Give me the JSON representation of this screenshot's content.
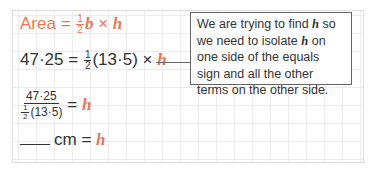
{
  "line1": {
    "lhs": "Area",
    "eq": "=",
    "frac_num": "1",
    "frac_den": "2",
    "b": "b",
    "times": "×",
    "h": "h"
  },
  "line2": {
    "lhs": "47·25",
    "eq": "=",
    "frac_num": "1",
    "frac_den": "2",
    "paren": "(13·5)",
    "times": "×",
    "h": "h"
  },
  "line3": {
    "num": "47·25",
    "den_frac_num": "1",
    "den_frac_den": "2",
    "den_paren": "(13·5)",
    "eq": "=",
    "h": "h"
  },
  "line4": {
    "unit": "cm",
    "eq": "=",
    "h": "h"
  },
  "callout": {
    "p1": "We are trying to find ",
    "h1": "h",
    "p2": " so we need to isolate ",
    "h2": "h",
    "p3": " on one side of the equals sign and all the other terms on the other side."
  },
  "colors": {
    "accent": "#e8775a",
    "text": "#333333",
    "grid": "#ececec"
  }
}
